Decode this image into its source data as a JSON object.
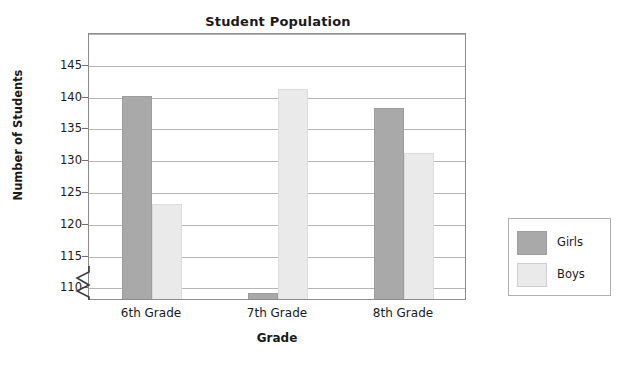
{
  "chart_data": {
    "type": "bar",
    "title": "Student Population",
    "xlabel": "Grade",
    "ylabel": "Number of Students",
    "categories": [
      "6th Grade",
      "7th Grade",
      "8th Grade"
    ],
    "series": [
      {
        "name": "Girls",
        "color": "#a9a9a9",
        "values": [
          140,
          109,
          138
        ]
      },
      {
        "name": "Boys",
        "color": "#eaeaea",
        "values": [
          123,
          141,
          131
        ]
      }
    ],
    "ylim": [
      108,
      150
    ],
    "yticks": [
      110,
      115,
      120,
      125,
      130,
      135,
      140,
      145
    ],
    "ytick_labels": [
      "110",
      "115",
      "120",
      "125",
      "130",
      "135",
      "140",
      "145"
    ],
    "gridlines": [
      110,
      115,
      120,
      125,
      130,
      135,
      140,
      145,
      150
    ],
    "grid": true,
    "axis_break": true,
    "axis_break_note": "y-axis broken below 110",
    "legend_position": "right-outside",
    "legend_entries": [
      "Girls",
      "Boys"
    ]
  }
}
